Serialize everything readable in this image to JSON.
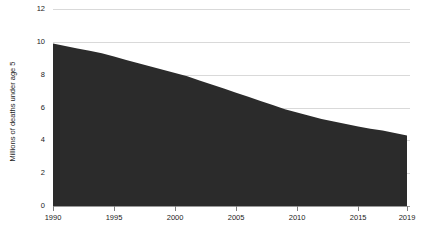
{
  "chart_data": {
    "type": "area",
    "title": "",
    "xlabel": "",
    "ylabel": "Millions of deaths under age 5",
    "xlim": [
      1990,
      2019
    ],
    "ylim": [
      0,
      12
    ],
    "grid": true,
    "legend": "none",
    "series_color": "#2b2b2b",
    "gridline_color": "#d9d9d9",
    "axis_color": "#9a9a9a",
    "x_tick_labels": [
      "1990",
      "1995",
      "2000",
      "2005",
      "2010",
      "2015",
      "2019"
    ],
    "x_ticks": [
      1990,
      1995,
      2000,
      2005,
      2010,
      2015,
      2019
    ],
    "y_tick_labels": [
      "0",
      "2",
      "4",
      "6",
      "8",
      "10",
      "12"
    ],
    "y_ticks": [
      0,
      2,
      4,
      6,
      8,
      10,
      12
    ],
    "x": [
      1990,
      1991,
      1992,
      1993,
      1994,
      1995,
      1996,
      1997,
      1998,
      1999,
      2000,
      2001,
      2002,
      2003,
      2004,
      2005,
      2006,
      2007,
      2008,
      2009,
      2010,
      2011,
      2012,
      2013,
      2014,
      2015,
      2016,
      2017,
      2018,
      2019
    ],
    "values": [
      9.9,
      9.75,
      9.6,
      9.45,
      9.3,
      9.1,
      8.9,
      8.7,
      8.5,
      8.3,
      8.1,
      7.9,
      7.65,
      7.4,
      7.15,
      6.9,
      6.65,
      6.4,
      6.15,
      5.9,
      5.7,
      5.5,
      5.3,
      5.15,
      5.0,
      4.85,
      4.7,
      4.6,
      4.45,
      4.3
    ]
  },
  "caption": {
    "text": ""
  }
}
